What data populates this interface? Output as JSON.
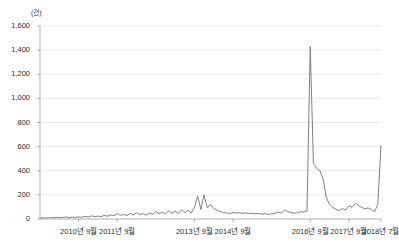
{
  "chart_data": {
    "type": "line",
    "title": "",
    "subtitle": "",
    "xlabel": "",
    "ylabel": "",
    "unit_label": "(건)",
    "ylim": [
      0,
      1600
    ],
    "yticks": [
      0,
      200,
      400,
      600,
      800,
      1000,
      1200,
      1400,
      1600
    ],
    "ytick_labels": [
      "0",
      "200",
      "400",
      "600",
      "800",
      "1,000",
      "1,200",
      "1,400",
      "1,600"
    ],
    "grid": true,
    "grid_axis": "y",
    "legend": "none",
    "line_color": "#808080",
    "line_width": 1,
    "xtick_labels": [
      "2010년 9월",
      "2011년 9월",
      "2013년 9월",
      "2014년 9월",
      "2016년 9월",
      "2017년 9월",
      "2018년 7월"
    ],
    "xtick_positions": [
      12,
      24,
      48,
      60,
      84,
      96,
      106
    ],
    "x_start": "2009년 9월",
    "x_end": "2018년 7월",
    "n_points": 107,
    "x": [
      0,
      1,
      2,
      3,
      4,
      5,
      6,
      7,
      8,
      9,
      10,
      11,
      12,
      13,
      14,
      15,
      16,
      17,
      18,
      19,
      20,
      21,
      22,
      23,
      24,
      25,
      26,
      27,
      28,
      29,
      30,
      31,
      32,
      33,
      34,
      35,
      36,
      37,
      38,
      39,
      40,
      41,
      42,
      43,
      44,
      45,
      46,
      47,
      48,
      49,
      50,
      51,
      52,
      53,
      54,
      55,
      56,
      57,
      58,
      59,
      60,
      61,
      62,
      63,
      64,
      65,
      66,
      67,
      68,
      69,
      70,
      71,
      72,
      73,
      74,
      75,
      76,
      77,
      78,
      79,
      80,
      81,
      82,
      83,
      84,
      85,
      86,
      87,
      88,
      89,
      90,
      91,
      92,
      93,
      94,
      95,
      96,
      97,
      98,
      99,
      100,
      101,
      102,
      103,
      104,
      105,
      106
    ],
    "values": [
      8,
      10,
      9,
      12,
      10,
      14,
      11,
      13,
      16,
      12,
      15,
      13,
      18,
      14,
      22,
      17,
      26,
      19,
      24,
      20,
      30,
      23,
      34,
      26,
      45,
      30,
      38,
      28,
      46,
      33,
      52,
      36,
      44,
      32,
      50,
      38,
      62,
      44,
      58,
      40,
      70,
      48,
      66,
      46,
      78,
      54,
      72,
      50,
      96,
      190,
      78,
      200,
      92,
      120,
      86,
      74,
      62,
      54,
      50,
      44,
      56,
      48,
      52,
      46,
      50,
      44,
      48,
      42,
      46,
      40,
      44,
      38,
      42,
      46,
      58,
      50,
      72,
      60,
      54,
      48,
      52,
      60,
      58,
      66,
      1430,
      460,
      420,
      400,
      330,
      180,
      120,
      96,
      80,
      70,
      88,
      74,
      110,
      96,
      130,
      112,
      96,
      84,
      92,
      78,
      60,
      120,
      610
    ],
    "annotations": [
      {
        "label": "최대 피크",
        "x": 84,
        "y": 1430
      },
      {
        "label": "최종값",
        "x": 106,
        "y": 610
      }
    ]
  },
  "layout": {
    "plot_left": 40,
    "plot_right": 381,
    "plot_top": 26,
    "plot_bottom": 219,
    "axis_color": "#999999",
    "grid_color": "#d9d9d9"
  }
}
